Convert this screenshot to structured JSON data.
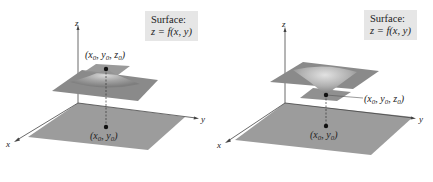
{
  "figures": [
    {
      "id": "maximum",
      "surface_label": {
        "line1": "Surface:",
        "line2": "z = f(x, y)"
      },
      "axes": {
        "x": "x",
        "y": "y",
        "z": "z"
      },
      "point_3d_label": "(x0, y0, z0)",
      "point_2d_label": "(x0, y0)",
      "surface_shape": "peak"
    },
    {
      "id": "minimum",
      "surface_label": {
        "line1": "Surface:",
        "line2": "z = f(x, y)"
      },
      "axes": {
        "x": "x",
        "y": "y",
        "z": "z"
      },
      "point_3d_label": "(x0, y0, z0)",
      "point_2d_label": "(x0, y0)",
      "surface_shape": "bowl"
    }
  ],
  "colors": {
    "plane_fill": "#9a9a9a",
    "surface_fill": "#8c8c8c",
    "label_box_bg": "#e6e6e6",
    "axis": "#333333"
  }
}
